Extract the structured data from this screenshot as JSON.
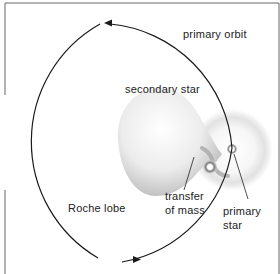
{
  "diagram": {
    "type": "binary star mass transfer",
    "labels": {
      "primary_orbit": "primary orbit",
      "secondary_star": "secondary star",
      "roche_lobe": "Roche lobe",
      "transfer_line1": "transfer",
      "transfer_line2": "of mass",
      "primary_line1": "primary",
      "primary_line2": "star"
    },
    "colors": {
      "line": "#1a1a1a",
      "frame": "#555555",
      "lobe_light": "#ffffff",
      "lobe_dark": "#b8b8b8",
      "halo": "#e4e4e4",
      "background": "#ffffff"
    }
  }
}
